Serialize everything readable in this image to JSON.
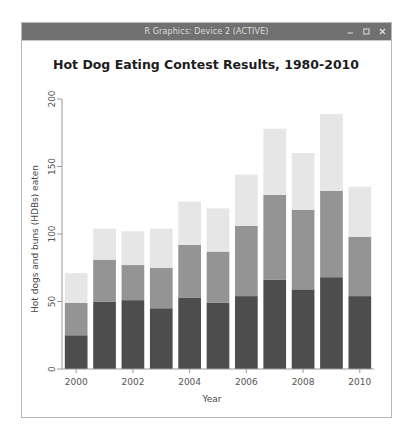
{
  "window": {
    "title": "R Graphics: Device 2 (ACTIVE)",
    "controls": [
      {
        "name": "minimize-button",
        "label": "–"
      },
      {
        "name": "maximize-button",
        "label": "□"
      },
      {
        "name": "close-button",
        "label": "×"
      }
    ],
    "titlebar_color": "#717171",
    "background_color": "#ffffff"
  },
  "chart_data": {
    "type": "bar",
    "subtype": "stacked",
    "title": "Hot Dog Eating Contest Results, 1980-2010",
    "xlabel": "Year",
    "ylabel": "Hot dogs and buns (HDBs) eaten",
    "categories": [
      "2000",
      "2001",
      "2002",
      "2003",
      "2004",
      "2005",
      "2006",
      "2007",
      "2008",
      "2009",
      "2010"
    ],
    "tick_labels_x": [
      "2000",
      "2002",
      "2004",
      "2006",
      "2008",
      "2010"
    ],
    "tick_values_y": [
      "0",
      "50",
      "100",
      "150",
      "200"
    ],
    "ylim": [
      0,
      200
    ],
    "grid": false,
    "legend": "none",
    "series": [
      {
        "name": "First place",
        "color": "#4d4d4d",
        "values": [
          25,
          50,
          51,
          45,
          53,
          49,
          54,
          66,
          59,
          68,
          54
        ]
      },
      {
        "name": "Second place",
        "color": "#949494",
        "values": [
          24,
          31,
          26,
          30,
          39,
          38,
          52,
          63,
          59,
          64,
          44
        ]
      },
      {
        "name": "Third place",
        "color": "#e6e6e6",
        "values": [
          22,
          23,
          25,
          29,
          32,
          32,
          38,
          49,
          42,
          57,
          37
        ]
      }
    ],
    "cumulative_totals": [
      71,
      104,
      102,
      104,
      124,
      119,
      144,
      178,
      160,
      189,
      135
    ]
  }
}
